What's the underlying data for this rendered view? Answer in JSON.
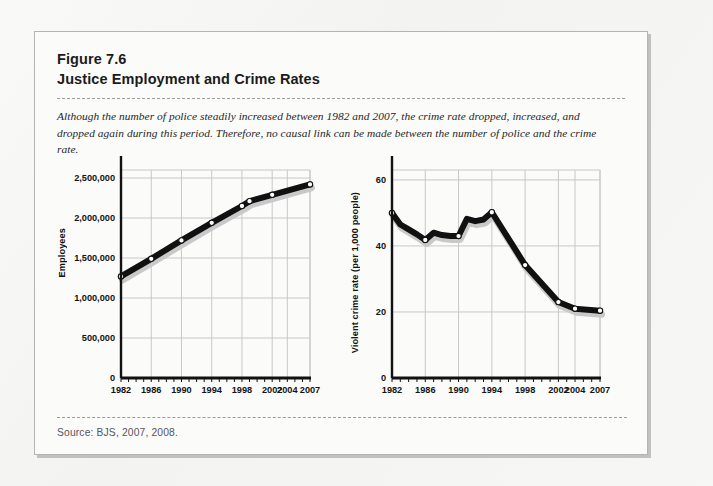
{
  "figure": {
    "number": "Figure 7.6",
    "title": "Justice Employment and Crime Rates",
    "caption": "Although the number of police steadily increased between 1982 and 2007, the crime rate dropped, increased, and dropped again during this period. Therefore, no causal link can be made between the number of police and the crime rate.",
    "source": "Source: BJS, 2007, 2008."
  },
  "colors": {
    "line": "#111111",
    "shadow": "#c9c9c9",
    "grid": "#c8c8c8",
    "axis": "#111111",
    "page_bg": "#f3f3f1",
    "box_bg": "#fbfbfa",
    "box_border": "#b4b4b2",
    "caption_text": "#262626",
    "source_text": "#55555a"
  },
  "chart_data": [
    {
      "type": "line",
      "name": "justice-employment",
      "title": "",
      "xlabel": "",
      "ylabel": "Employees",
      "x": [
        1982,
        1986,
        1990,
        1994,
        1998,
        1999,
        2002,
        2007
      ],
      "values": [
        1270000,
        1490000,
        1720000,
        1940000,
        2150000,
        2210000,
        2290000,
        2420000
      ],
      "xtick_labels": [
        "1982",
        "1986",
        "1990",
        "1994",
        "1998",
        "2002",
        "2004",
        "2007"
      ],
      "xtick_values": [
        1982,
        1986,
        1990,
        1994,
        1998,
        2002,
        2004,
        2007
      ],
      "ytick_labels": [
        "0",
        "500,000",
        "1,000,000",
        "1,500,000",
        "2,000,000",
        "2,500,000"
      ],
      "ytick_values": [
        0,
        500000,
        1000000,
        1500000,
        2000000,
        2500000
      ],
      "xlim": [
        1982,
        2007
      ],
      "ylim": [
        0,
        2600000
      ],
      "grid": true,
      "markers": "open-circle",
      "legend": "none"
    },
    {
      "type": "line",
      "name": "violent-crime-rate",
      "title": "",
      "xlabel": "",
      "ylabel": "Violent crime rate (per 1,000 people)",
      "x": [
        1982,
        1983,
        1984,
        1985,
        1986,
        1987,
        1988,
        1989,
        1990,
        1991,
        1992,
        1993,
        1994,
        1998,
        2002,
        2004,
        2007
      ],
      "values": [
        50.0,
        46.5,
        45.0,
        43.5,
        41.8,
        44.0,
        43.3,
        43.0,
        43.0,
        48.2,
        47.5,
        48.0,
        50.2,
        34.2,
        23.0,
        21.0,
        20.4
      ],
      "labeled_points": [
        {
          "x": 1982,
          "y": 50.0
        },
        {
          "x": 1986,
          "y": 41.8
        },
        {
          "x": 1990,
          "y": 43.0
        },
        {
          "x": 1994,
          "y": 50.2
        },
        {
          "x": 1998,
          "y": 34.2
        },
        {
          "x": 2002,
          "y": 23.0
        },
        {
          "x": 2004,
          "y": 21.0
        },
        {
          "x": 2007,
          "y": 20.4
        }
      ],
      "xtick_labels": [
        "1982",
        "1986",
        "1990",
        "1994",
        "1998",
        "2002",
        "2004",
        "2007"
      ],
      "xtick_values": [
        1982,
        1986,
        1990,
        1994,
        1998,
        2002,
        2004,
        2007
      ],
      "ytick_labels": [
        "0",
        "20",
        "40",
        "60"
      ],
      "ytick_values": [
        0,
        20,
        40,
        60
      ],
      "xlim": [
        1982,
        2007
      ],
      "ylim": [
        0,
        63
      ],
      "grid": true,
      "markers": "open-circle",
      "legend": "none"
    }
  ]
}
